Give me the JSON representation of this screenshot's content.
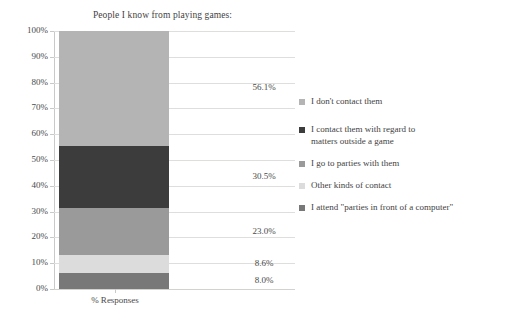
{
  "chart_data": {
    "type": "bar",
    "subtype": "stacked-single-column",
    "title": "People I know from playing games:",
    "xlabel": "% Responses",
    "ylabel": "",
    "categories": [
      "% Responses"
    ],
    "ylim": [
      0,
      100
    ],
    "ytick_labels": [
      "0%",
      "10%",
      "20%",
      "30%",
      "40%",
      "50%",
      "60%",
      "70%",
      "80%",
      "90%",
      "100%"
    ],
    "ytick_values": [
      0,
      10,
      20,
      30,
      40,
      50,
      60,
      70,
      80,
      90,
      100
    ],
    "grid": true,
    "legend_position": "right",
    "normalized_total": 126.2,
    "series": [
      {
        "name": "I don't contact them",
        "value": 56.1,
        "label": "56.1%",
        "color": "#b4b4b4"
      },
      {
        "name": "I contact them with regard to matters outside a game",
        "value": 30.5,
        "label": "30.5%",
        "color": "#3c3c3c"
      },
      {
        "name": "I go to parties with them",
        "value": 23.0,
        "label": "23.0%",
        "color": "#9a9a9a"
      },
      {
        "name": "Other kinds of contact",
        "value": 8.6,
        "label": "8.6%",
        "color": "#dcdcdc"
      },
      {
        "name": "I attend \"parties in front of a computer\"",
        "value": 8.0,
        "label": "8.0%",
        "color": "#787878"
      }
    ]
  },
  "legend": {
    "items": [
      {
        "label": "I don't contact them",
        "color": "#b4b4b4"
      },
      {
        "label": "I contact them with regard to\nmatters outside a game",
        "color": "#3c3c3c"
      },
      {
        "label": "I go to parties with them",
        "color": "#9a9a9a"
      },
      {
        "label": "Other kinds of contact",
        "color": "#dcdcdc"
      },
      {
        "label": "I attend \"parties in front of a computer\"",
        "color": "#787878"
      }
    ]
  },
  "colors": {
    "grid": "#dededc",
    "axis": "#c9c9c7",
    "text": "#3f3f3f",
    "background": "#ffffff"
  }
}
